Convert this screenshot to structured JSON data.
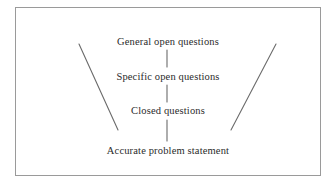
{
  "diagram": {
    "border_color": "#9a9a9a",
    "line_color": "#6b6b6b",
    "text_color": "#2b2b2b",
    "background": "#ffffff",
    "levels": [
      {
        "label": "General open questions"
      },
      {
        "label": "Specific open questions"
      },
      {
        "label": "Closed questions"
      },
      {
        "label": "Accurate problem statement"
      }
    ],
    "connectors": [
      {
        "name": "connector-1"
      },
      {
        "name": "connector-2"
      },
      {
        "name": "connector-3"
      }
    ],
    "funnel_sides": [
      {
        "name": "left-funnel-line",
        "x1": 79,
        "y1": 44,
        "x2": 118,
        "y2": 130
      },
      {
        "name": "right-funnel-line",
        "x1": 276,
        "y1": 44,
        "x2": 231,
        "y2": 130
      }
    ]
  }
}
